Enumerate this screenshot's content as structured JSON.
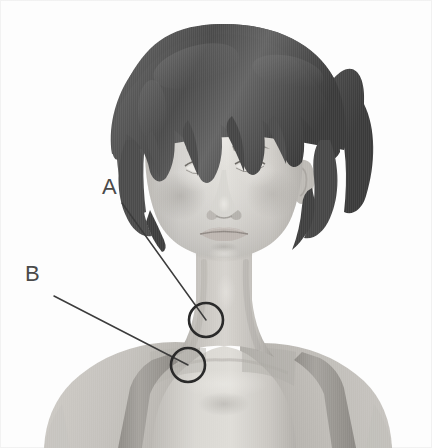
{
  "figure": {
    "kind": "anatomical-illustration",
    "orientation": "frontal",
    "color_mode": "grayscale",
    "background_color": "#fdfdfd",
    "frame_color": "#f1f1f1"
  },
  "palette": {
    "background": "#fdfdfd",
    "hair_dark": "#4c4c4c",
    "hair_mid": "#616161",
    "hair_light": "#757575",
    "skin_light": "#d8d6d2",
    "skin_mid": "#c7c4bf",
    "skin_shadow": "#b0ada8",
    "skin_deep_shadow": "#9a9792",
    "skin_highlight": "#e6e4e0",
    "garment": "#b9b6b1",
    "garment_strap": "#9d9a95",
    "annotation_line": "#3c3c3c",
    "annotation_circle": "#2a2a2a",
    "annotation_text": "#4a4a4a",
    "eye_iris": "#8a8a8a",
    "eye_white": "#eceae6",
    "lip": "#bdb6b1",
    "lip_shadow": "#a39c97"
  },
  "annotations": [
    {
      "id": "A",
      "label": "A",
      "label_position": {
        "x": 102,
        "y": 176
      },
      "leader_line": {
        "x1": 122,
        "y1": 203,
        "x2": 206,
        "y2": 320
      },
      "marker_circle": {
        "cx": 206,
        "cy": 320,
        "r": 17
      },
      "marker_shape": "circle"
    },
    {
      "id": "B",
      "label": "B",
      "label_position": {
        "x": 25,
        "y": 263
      },
      "leader_line": {
        "x1": 54,
        "y1": 296,
        "x2": 188,
        "y2": 365
      },
      "marker_circle": {
        "cx": 188,
        "cy": 365,
        "r": 17
      },
      "marker_shape": "circle"
    }
  ],
  "geometry": {
    "canvas": {
      "width": 432,
      "height": 448
    },
    "circle_stroke_width": 2.6,
    "line_stroke_width": 1.5
  }
}
